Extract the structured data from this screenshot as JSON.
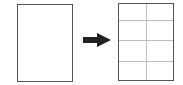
{
  "diagram": {
    "left_page": {
      "label": "",
      "type": "blank-page"
    },
    "arrow": {
      "direction": "right",
      "color": "#222222"
    },
    "right_page": {
      "label": "",
      "type": "grid-page",
      "columns": 2,
      "rows": 4,
      "grid_color": "#bdbdbd"
    },
    "border_color": "#555555"
  }
}
